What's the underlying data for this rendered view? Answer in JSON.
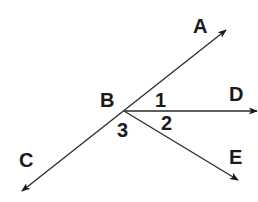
{
  "diagram": {
    "type": "geometry-angles",
    "vertex": {
      "label": "B",
      "x": 124,
      "y": 111
    },
    "rays": [
      {
        "name": "BA",
        "label": "A",
        "end": [
          226,
          30
        ]
      },
      {
        "name": "BD",
        "label": "D",
        "end": [
          257,
          111
        ]
      },
      {
        "name": "BE",
        "label": "E",
        "end": [
          238,
          180
        ]
      },
      {
        "name": "BC",
        "label": "C",
        "end": [
          22,
          191
        ]
      }
    ],
    "labels": {
      "A": "A",
      "B": "B",
      "C": "C",
      "D": "D",
      "E": "E",
      "angle1": "1",
      "angle2": "2",
      "angle3": "3"
    },
    "line_color": "#2a2a2a"
  }
}
